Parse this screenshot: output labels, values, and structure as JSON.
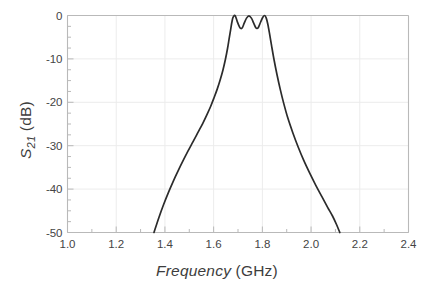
{
  "chart_data": {
    "type": "line",
    "title": "",
    "xlabel_italic": "Frequency",
    "xlabel_unit": " (GHz)",
    "ylabel_symbol": "S",
    "ylabel_subscript": "21",
    "ylabel_unit": " (dB)",
    "xlabel": "Frequency (GHz)",
    "ylabel": "S21 (dB)",
    "xlim": [
      1.0,
      2.4
    ],
    "ylim": [
      -50,
      0
    ],
    "xticks": [
      1.0,
      1.2,
      1.4,
      1.6,
      1.8,
      2.0,
      2.2,
      2.4
    ],
    "xtick_labels": [
      "1.0",
      "1.2",
      "1.4",
      "1.6",
      "1.8",
      "2.0",
      "2.2",
      "2.4"
    ],
    "yticks": [
      0,
      -10,
      -20,
      -30,
      -40,
      -50
    ],
    "ytick_labels": [
      "0",
      "-10",
      "-20",
      "-30",
      "-40",
      "-50"
    ],
    "x_minor_step": 0.1,
    "y_minor_step": 2.5,
    "grid": true,
    "grid_color": "#ececec",
    "legend": null,
    "line_color": "#2b2b2b",
    "line_width": 1.7,
    "frame_color": "#b9b9b9",
    "passband_peaks_ghz": [
      1.68,
      1.745,
      1.81
    ],
    "passband_ripple_db": 3.0,
    "stopband_floor_db": -50,
    "series": [
      {
        "name": "S21",
        "x": [
          1.355,
          1.375,
          1.395,
          1.415,
          1.435,
          1.455,
          1.475,
          1.495,
          1.515,
          1.535,
          1.555,
          1.572,
          1.588,
          1.602,
          1.615,
          1.627,
          1.638,
          1.648,
          1.657,
          1.664,
          1.67,
          1.675,
          1.68,
          1.688,
          1.697,
          1.706,
          1.712,
          1.718,
          1.726,
          1.735,
          1.745,
          1.755,
          1.764,
          1.772,
          1.778,
          1.784,
          1.793,
          1.802,
          1.81,
          1.816,
          1.822,
          1.829,
          1.838,
          1.848,
          1.86,
          1.873,
          1.888,
          1.905,
          1.925,
          1.947,
          1.97,
          1.995,
          2.02,
          2.045,
          2.068,
          2.088,
          2.104,
          2.118
        ],
        "y": [
          -50.0,
          -46.6,
          -43.5,
          -40.7,
          -38.1,
          -35.7,
          -33.4,
          -31.2,
          -29.1,
          -27.0,
          -24.9,
          -22.9,
          -20.9,
          -18.9,
          -16.9,
          -14.8,
          -12.6,
          -10.2,
          -7.6,
          -5.2,
          -3.2,
          -1.5,
          -0.4,
          0.0,
          -1.4,
          -2.6,
          -3.0,
          -2.8,
          -1.7,
          -0.6,
          -0.1,
          -0.6,
          -1.7,
          -2.7,
          -3.0,
          -2.7,
          -1.5,
          -0.4,
          0.0,
          -0.6,
          -1.9,
          -4.0,
          -7.0,
          -10.2,
          -13.6,
          -16.9,
          -20.3,
          -23.7,
          -27.0,
          -30.3,
          -33.4,
          -36.4,
          -39.2,
          -41.8,
          -44.2,
          -46.2,
          -48.1,
          -50.0
        ]
      }
    ]
  }
}
